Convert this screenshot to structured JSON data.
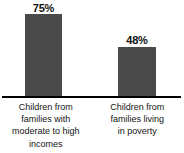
{
  "chart_data": {
    "type": "bar",
    "title": "",
    "xlabel": "",
    "ylabel": "",
    "ylim": [
      0,
      100
    ],
    "grid": false,
    "legend": "none",
    "categories": [
      "Children from families with moderate to high incomes",
      "Children from families living in poverty"
    ],
    "values": [
      75,
      48
    ],
    "value_labels": [
      "75%",
      "48%"
    ],
    "bar_color": "#4a4a4a",
    "axis_color": "#000000",
    "background_color": "#ffffff"
  },
  "bars": [
    {
      "value_label": "75%",
      "caption_lines": [
        "Children from",
        "families with",
        "moderate to high",
        "incomes"
      ]
    },
    {
      "value_label": "48%",
      "caption_lines": [
        "Children from",
        "families living",
        "in poverty"
      ]
    }
  ]
}
